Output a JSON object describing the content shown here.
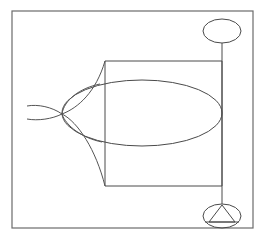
{
  "document": {
    "title": "Geometric Line Diagram",
    "background_color": "#ffffff",
    "width": 264,
    "height": 237
  },
  "palette": {
    "stroke": "#4a4a4a",
    "frame_stroke": "#6b6b6b",
    "curve_stroke": "#545454",
    "background": "#ffffff"
  },
  "figure": {
    "caption": "",
    "elements": [
      {
        "name": "outer-frame",
        "type": "rectangle",
        "x": 12,
        "y": 11,
        "width": 241,
        "height": 217
      },
      {
        "name": "inner-rectangle",
        "type": "rectangle",
        "x": 105,
        "y": 61,
        "width": 117,
        "height": 125
      },
      {
        "name": "large-ellipse",
        "type": "ellipse",
        "cx": 142,
        "cy": 113,
        "rx": 80,
        "ry": 33
      },
      {
        "name": "top-ellipse",
        "type": "ellipse",
        "cx": 222,
        "cy": 31,
        "rx": 19,
        "ry": 12
      },
      {
        "name": "bottom-ellipse",
        "type": "ellipse",
        "cx": 222,
        "cy": 216,
        "rx": 19,
        "ry": 12
      },
      {
        "name": "connector-line",
        "type": "line",
        "x1": 222,
        "y1": 43,
        "x2": 222,
        "y2": 204
      },
      {
        "name": "inscribed-triangle",
        "type": "polygon",
        "points": "222,205 209,222 235,222"
      },
      {
        "name": "triangle-base-chord",
        "type": "line",
        "x1": 205,
        "y1": 222,
        "x2": 239,
        "y2": 222
      },
      {
        "name": "cusp-node",
        "type": "point",
        "x": 62,
        "y": 114
      },
      {
        "name": "cusp-upper-branch",
        "type": "curve",
        "path": "M 62,114 C 78,108 96,92 105,61"
      },
      {
        "name": "cusp-lower-branch",
        "type": "curve",
        "path": "M 62,114 C 78,122 96,150 105,186"
      },
      {
        "name": "tail-upper",
        "type": "curve",
        "path": "M 62,114 C 52,107 38,104 27,106"
      },
      {
        "name": "tail-lower",
        "type": "curve",
        "path": "M 62,114 C 52,119 38,121 27,119"
      },
      {
        "name": "loop-upper",
        "type": "curve",
        "path": "M 62,114 C 64,100 80,88 100,84"
      },
      {
        "name": "loop-lower",
        "type": "curve",
        "path": "M 62,114 C 66,126 82,138 102,142"
      }
    ]
  }
}
